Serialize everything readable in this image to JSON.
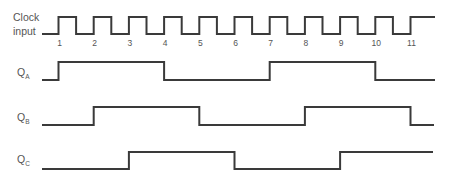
{
  "diagram": {
    "type": "timing-diagram",
    "signals": [
      {
        "id": "clock",
        "label_line1": "Clock",
        "label_line2": "input",
        "kind": "clock",
        "pulse_numbers": [
          "1",
          "2",
          "3",
          "4",
          "5",
          "6",
          "7",
          "8",
          "9",
          "10",
          "11"
        ],
        "initial": 0,
        "transitions_at_clock": [
          1,
          1.5,
          2,
          2.5,
          3,
          3.5,
          4,
          4.5,
          5,
          5.5,
          6,
          6.5,
          7,
          7.5,
          8,
          8.5,
          9,
          9.5,
          10,
          10.5,
          11
        ]
      },
      {
        "id": "qa",
        "label_main": "Q",
        "label_sub": "A",
        "initial": 0,
        "transitions_at_clock": [
          1,
          4,
          7,
          10
        ]
      },
      {
        "id": "qb",
        "label_main": "Q",
        "label_sub": "B",
        "initial": 0,
        "transitions_at_clock": [
          2,
          5,
          8,
          11
        ]
      },
      {
        "id": "qc",
        "label_main": "Q",
        "label_sub": "C",
        "initial": 0,
        "transitions_at_clock": [
          3,
          6,
          9
        ]
      }
    ],
    "colors": {
      "line": "#3a3a3a",
      "text": "#555555",
      "background": "#ffffff"
    }
  }
}
